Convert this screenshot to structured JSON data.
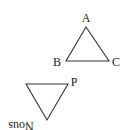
{
  "diagram": {
    "line_color": "#333333",
    "label_color": "#222222",
    "triangle_abc": {
      "labels": {
        "a": "A",
        "b": "B",
        "c": "C"
      },
      "vertices": {
        "a": [
          86,
          27
        ],
        "b": [
          66,
          61
        ],
        "c": [
          109,
          61
        ]
      }
    },
    "triangle_p": {
      "labels": {
        "p": "P",
        "bottom": "Nous"
      },
      "bottom_label_rotation_deg": 180,
      "vertices": {
        "top_left": [
          26,
          84
        ],
        "p": [
          68,
          84
        ],
        "bottom": [
          47,
          120
        ]
      }
    }
  }
}
